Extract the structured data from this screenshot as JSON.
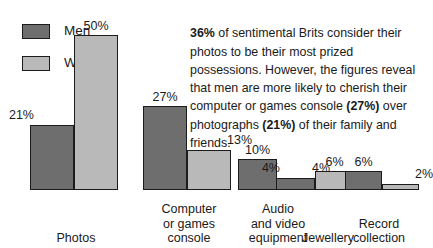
{
  "legend": {
    "items": [
      {
        "label": "Men",
        "color": "#6e6e6e",
        "key": "men"
      },
      {
        "label": "Women",
        "color": "#b9b9b9",
        "key": "women"
      }
    ]
  },
  "blurb": {
    "b1": "36%",
    "t1": " of sentimental Brits consider their photos to be their most prized possessions. However, the figures reveal that men are more likely to cherish their computer or games console ",
    "b2": "(27%)",
    "t2": " over photographs ",
    "b3": "(21%)",
    "t3": " of their family and friends."
  },
  "chart_data": {
    "type": "bar",
    "title": "",
    "xlabel": "",
    "ylabel": "",
    "ylim": [
      0,
      50
    ],
    "grid": false,
    "legend_position": "top-left",
    "value_suffix": "%",
    "categories": [
      "Photos",
      "Computer or games console",
      "Audio and video equipment",
      "Jewellery",
      "Record collection"
    ],
    "category_lines": [
      [
        "Photos"
      ],
      [
        "Computer",
        "or games",
        "console"
      ],
      [
        "Audio",
        "and video",
        "equipment"
      ],
      [
        "Jewellery"
      ],
      [
        "Record",
        "collection"
      ]
    ],
    "series": [
      {
        "name": "Men",
        "color": "#6e6e6e",
        "values": [
          21,
          27,
          10,
          4,
          6
        ]
      },
      {
        "name": "Women",
        "color": "#b9b9b9",
        "values": [
          50,
          13,
          4,
          6,
          2
        ]
      }
    ],
    "value_labels": {
      "men": [
        "21%",
        "27%",
        "10%",
        "4%",
        "6%"
      ],
      "women": [
        "50%",
        "13%",
        "4%",
        "6%",
        "2%"
      ]
    }
  },
  "layout": {
    "groups": [
      {
        "left": 30,
        "width": 92,
        "bar_w": 44,
        "label_left": 30,
        "label_width": 92
      },
      {
        "left": 143,
        "width": 92,
        "bar_w": 44,
        "label_left": 140,
        "label_width": 98
      },
      {
        "left": 238,
        "width": 80,
        "bar_w": 39,
        "label_left": 232,
        "label_width": 92
      },
      {
        "left": 276,
        "width": 80,
        "bar_w": 39,
        "label_left": 288,
        "label_width": 80
      },
      {
        "left": 345,
        "width": 76,
        "bar_w": 37,
        "label_left": 338,
        "label_width": 82
      }
    ],
    "px_per_unit": 3.1
  }
}
